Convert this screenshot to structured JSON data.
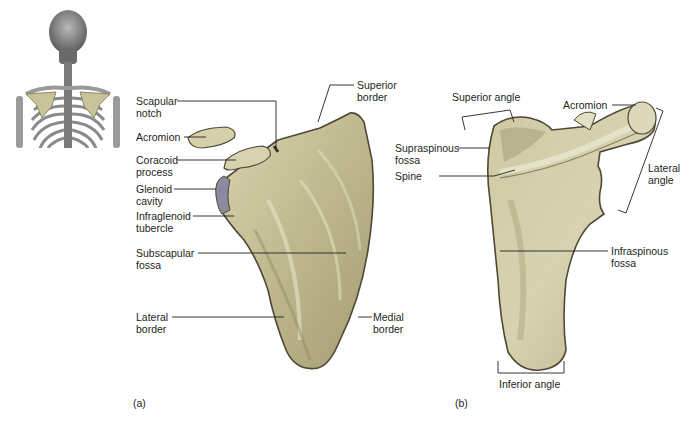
{
  "figure": {
    "colors": {
      "bone_fill": "#c9c39a",
      "bone_shadow": "#9a9270",
      "bone_dark": "#5a5440",
      "bone_highlight": "#e4e0c4",
      "glenoid": "#8a8aa0",
      "leader_line": "#231f20",
      "skeleton_gray": "#9a9a9a"
    },
    "thumbnail": {
      "alt": "Posterior view of upper skeleton with scapulae highlighted"
    },
    "panel_a": {
      "caption": "(a)",
      "labels": {
        "scapular_notch_1": "Scapular",
        "scapular_notch_2": "notch",
        "acromion": "Acromion",
        "coracoid_1": "Coracoid",
        "coracoid_2": "process",
        "glenoid_1": "Glenoid",
        "glenoid_2": "cavity",
        "infraglenoid_1": "Infraglenoid",
        "infraglenoid_2": "tubercle",
        "subscapular_1": "Subscapular",
        "subscapular_2": "fossa",
        "lateral_border_1": "Lateral",
        "lateral_border_2": "border",
        "superior_border_1": "Superior",
        "superior_border_2": "border",
        "medial_border_1": "Medial",
        "medial_border_2": "border"
      }
    },
    "panel_b": {
      "caption": "(b)",
      "labels": {
        "superior_angle": "Superior angle",
        "acromion": "Acromion",
        "supraspinous_1": "Supraspinous",
        "supraspinous_2": "fossa",
        "spine": "Spine",
        "lateral_angle_1": "Lateral",
        "lateral_angle_2": "angle",
        "infraspinous_1": "Infraspinous",
        "infraspinous_2": "fossa",
        "inferior_angle": "Inferior angle"
      }
    }
  }
}
